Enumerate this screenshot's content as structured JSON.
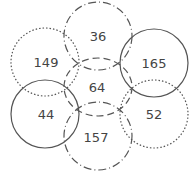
{
  "diagram": {
    "type": "venn",
    "sets": [
      {
        "name": "top-dashdot",
        "style": "dashdot",
        "cx": 98,
        "cy": 36,
        "r": 34
      },
      {
        "name": "bottom-dashdot",
        "style": "dashdot",
        "cx": 98,
        "cy": 136,
        "r": 34
      },
      {
        "name": "middle-dashed",
        "style": "dashed",
        "cx": 98,
        "cy": 86,
        "r": 34
      },
      {
        "name": "left-dotted",
        "style": "dotted",
        "cx": 45,
        "cy": 62,
        "r": 34
      },
      {
        "name": "left-solid",
        "style": "solid",
        "cx": 45,
        "cy": 114,
        "r": 34
      },
      {
        "name": "right-solid",
        "style": "solid",
        "cx": 154,
        "cy": 63,
        "r": 34
      },
      {
        "name": "right-dotted",
        "style": "dotted",
        "cx": 154,
        "cy": 114,
        "r": 34
      }
    ],
    "labels": [
      {
        "text": "36",
        "x": 98,
        "y": 36
      },
      {
        "text": "149",
        "x": 46,
        "y": 62
      },
      {
        "text": "165",
        "x": 154,
        "y": 63
      },
      {
        "text": "64",
        "x": 97,
        "y": 87
      },
      {
        "text": "44",
        "x": 46,
        "y": 114
      },
      {
        "text": "52",
        "x": 154,
        "y": 114
      },
      {
        "text": "157",
        "x": 96,
        "y": 137
      }
    ]
  }
}
